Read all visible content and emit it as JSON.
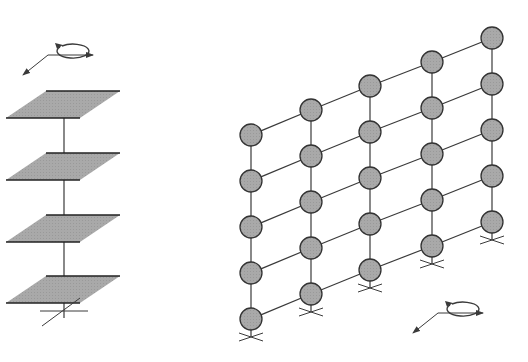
{
  "colors": {
    "line": "#3a3a3a",
    "fill": "#a9a9a9",
    "background": "#ffffff"
  },
  "left_model": {
    "description": "Lumped-mass shear building model with floor slabs on a single column",
    "slabs_y": [
      91,
      153,
      215,
      276
    ],
    "column_x": 64,
    "base_y": 318,
    "motion_icon": {
      "cx": 48,
      "cy": 55,
      "type": "base-motion-arrows"
    }
  },
  "right_model": {
    "description": "Grid of lumped masses (5 columns x 5 rows) with fixed supports",
    "columns_x": [
      251,
      311,
      370,
      432,
      492
    ],
    "column_top_y": [
      135,
      110,
      86,
      62,
      38
    ],
    "row_spacing": 46,
    "rows": 5,
    "node_radius": 11,
    "motion_icon": {
      "cx": 438,
      "cy": 313,
      "type": "base-motion-arrows"
    }
  }
}
